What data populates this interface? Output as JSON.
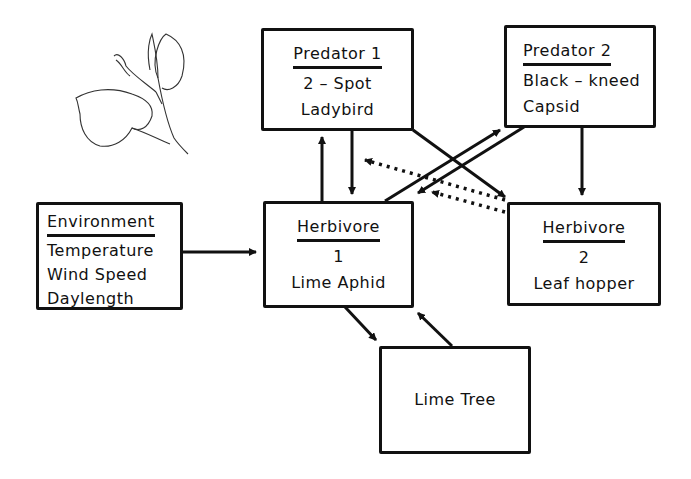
{
  "diagram": {
    "nodes": {
      "predator1": {
        "title": "Predator   1",
        "lines": [
          "2 – Spot",
          "Ladybird"
        ]
      },
      "predator2": {
        "title": "Predator   2",
        "lines": [
          "Black – kneed",
          "Capsid"
        ]
      },
      "environment": {
        "title": "Environment",
        "lines": [
          "Temperature",
          "Wind  Speed",
          "Daylength"
        ]
      },
      "herbivore1": {
        "title": "Herbivore",
        "lines": [
          "1",
          "Lime  Aphid"
        ]
      },
      "herbivore2": {
        "title": "Herbivore",
        "lines": [
          "2",
          "Leaf hopper"
        ]
      },
      "limetree": {
        "lines": [
          "Lime  Tree"
        ]
      }
    },
    "edges": [
      {
        "from": "herbivore1",
        "to": "predator1",
        "style": "solid"
      },
      {
        "from": "predator1",
        "to": "herbivore1",
        "style": "solid"
      },
      {
        "from": "predator1",
        "to": "herbivore2",
        "style": "solid"
      },
      {
        "from": "herbivore1",
        "to": "predator2",
        "style": "solid"
      },
      {
        "from": "predator2",
        "to": "herbivore1",
        "style": "solid"
      },
      {
        "from": "predator2",
        "to": "herbivore2",
        "style": "solid"
      },
      {
        "from": "herbivore2",
        "to": "predator1",
        "style": "dotted"
      },
      {
        "from": "herbivore2",
        "to": "herbivore1",
        "style": "dotted"
      },
      {
        "from": "environment",
        "to": "herbivore1",
        "style": "solid"
      },
      {
        "from": "herbivore1",
        "to": "limetree",
        "style": "solid"
      },
      {
        "from": "limetree",
        "to": "herbivore1",
        "style": "solid"
      }
    ],
    "illustration": "lime-leaf-sprig"
  }
}
